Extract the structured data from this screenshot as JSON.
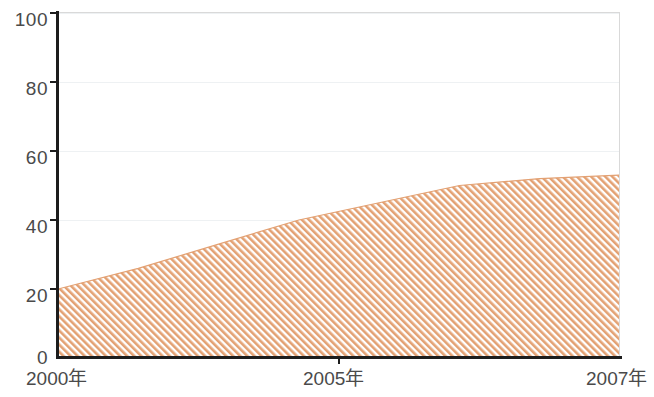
{
  "chart_data": {
    "type": "area",
    "title": "",
    "subtitle": "",
    "xlabel": "",
    "ylabel": "",
    "grid": true,
    "legend": null,
    "xlim": [
      2000,
      2007
    ],
    "ylim": [
      0,
      100
    ],
    "x": [
      2000,
      2001,
      2002,
      2003,
      2004,
      2005,
      2006,
      2007
    ],
    "categories": [
      "2000",
      "2001",
      "2002",
      "2003",
      "2004",
      "2005",
      "2006",
      "2007"
    ],
    "values": [
      20,
      26,
      33,
      40,
      45,
      50,
      52,
      53
    ],
    "series": [
      {
        "name": "",
        "values": [
          20,
          26,
          33,
          40,
          45,
          50,
          52,
          53
        ],
        "fill_pattern": "diagonal-hatch",
        "fill_color": "#E3A173",
        "line_color": "#E3A173"
      }
    ],
    "y_ticks": [
      0,
      20,
      40,
      60,
      80,
      100
    ],
    "y_tick_labels": [
      "0",
      "20",
      "40",
      "60",
      "80",
      "100"
    ],
    "x_tick_labels": [
      "2000年",
      "2005年",
      "2007年"
    ],
    "x_tick_positions": [
      2000,
      2005,
      2007
    ],
    "colors": {
      "axis": "#1d1d1d",
      "grid": "#eef1f3",
      "frame": "#d9d9d9",
      "tick_label": "#4a4a4a",
      "series_fill": "#E3A173",
      "background": "#ffffff"
    }
  }
}
